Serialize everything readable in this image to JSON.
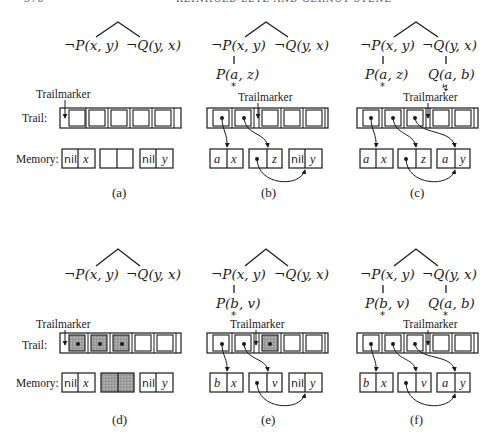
{
  "header": {
    "page_number": "376",
    "running_title": "REINHOLD LETZ AND GERNOT STENZ"
  },
  "labels": {
    "trailmarker": "Trailmarker",
    "trail": "Trail:",
    "memory": "Memory:",
    "nil": "nil"
  },
  "literals": {
    "negP": "¬P(x, y)",
    "negQ": "¬Q(y, x)",
    "Paz": "P(a, z)",
    "Pbv": "P(b, v)",
    "Qab": "Q(a, b)",
    "star": "*",
    "lightning": "↯"
  },
  "panels": [
    {
      "id": "a",
      "caption": "(a)",
      "memory": [
        [
          "nil",
          "x"
        ],
        [
          "",
          ""
        ],
        [
          "nil",
          "y"
        ]
      ]
    },
    {
      "id": "b",
      "caption": "(b)",
      "memory": [
        [
          "a",
          "x"
        ],
        [
          "•",
          "z"
        ],
        [
          "nil",
          "y"
        ]
      ]
    },
    {
      "id": "c",
      "caption": "(c)",
      "memory": [
        [
          "a",
          "x"
        ],
        [
          "•",
          "z"
        ],
        [
          "a",
          "y"
        ]
      ]
    },
    {
      "id": "d",
      "caption": "(d)",
      "memory": [
        [
          "nil",
          "x"
        ],
        [
          "",
          ""
        ],
        [
          "nil",
          "y"
        ]
      ]
    },
    {
      "id": "e",
      "caption": "(e)",
      "memory": [
        [
          "b",
          "x"
        ],
        [
          "•",
          "v"
        ],
        [
          "nil",
          "y"
        ]
      ]
    },
    {
      "id": "f",
      "caption": "(f)",
      "memory": [
        [
          "b",
          "x"
        ],
        [
          "•",
          "v"
        ],
        [
          "a",
          "y"
        ]
      ]
    }
  ],
  "colors": {
    "ink": "#1a1a1a",
    "shaded": "#9a9a9a",
    "background": "#ffffff"
  }
}
